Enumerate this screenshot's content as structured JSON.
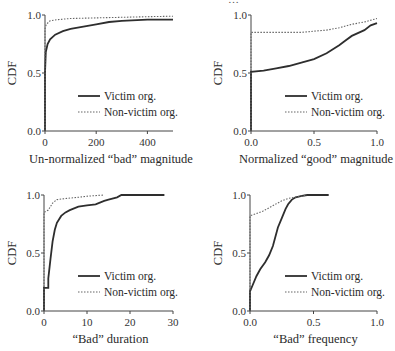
{
  "page_header": "…",
  "legend": {
    "victim": "Victim org.",
    "nonvictim": "Non-victim org."
  },
  "chart_data": [
    {
      "type": "line",
      "title": "",
      "xlabel": "Un-normalized “bad” magnitude",
      "ylabel": "CDF",
      "xlim": [
        0,
        500
      ],
      "ylim": [
        0,
        1
      ],
      "xticks": [
        0,
        200,
        400
      ],
      "xtick_labels": [
        "0",
        "200",
        "400"
      ],
      "yticks": [
        0,
        0.5,
        1
      ],
      "ytick_labels": [
        "0.0",
        "0.5",
        "1.0"
      ],
      "grid": false,
      "legend_position": "lower right",
      "series": [
        {
          "name": "Victim org.",
          "style": "solid",
          "x": [
            0,
            0,
            3,
            10,
            20,
            40,
            70,
            100,
            150,
            200,
            250,
            300,
            400,
            500
          ],
          "y": [
            0,
            0.5,
            0.68,
            0.75,
            0.79,
            0.83,
            0.86,
            0.88,
            0.9,
            0.92,
            0.94,
            0.95,
            0.96,
            0.96
          ]
        },
        {
          "name": "Non-victim org.",
          "style": "dotted",
          "x": [
            0,
            0,
            5,
            20,
            50,
            100,
            200,
            300,
            400,
            500
          ],
          "y": [
            0,
            0.88,
            0.92,
            0.95,
            0.96,
            0.97,
            0.975,
            0.98,
            0.985,
            0.99
          ]
        }
      ]
    },
    {
      "type": "line",
      "title": "",
      "xlabel": "Normalized “good” magnitude",
      "ylabel": "CDF",
      "xlim": [
        0,
        1
      ],
      "ylim": [
        0,
        1
      ],
      "xticks": [
        0,
        0.5,
        1
      ],
      "xtick_labels": [
        "0.0",
        "0.5",
        "1.0"
      ],
      "yticks": [
        0,
        0.5,
        1
      ],
      "ytick_labels": [
        "0.0",
        "0.5",
        "1.0"
      ],
      "grid": false,
      "legend_position": "lower right",
      "series": [
        {
          "name": "Victim org.",
          "style": "solid",
          "x": [
            0,
            0,
            0.1,
            0.2,
            0.3,
            0.4,
            0.5,
            0.6,
            0.7,
            0.75,
            0.8,
            0.9,
            0.95,
            1.0
          ],
          "y": [
            0,
            0.51,
            0.52,
            0.54,
            0.56,
            0.59,
            0.62,
            0.67,
            0.74,
            0.78,
            0.82,
            0.87,
            0.91,
            0.93
          ]
        },
        {
          "name": "Non-victim org.",
          "style": "dotted",
          "x": [
            0,
            0,
            0.2,
            0.4,
            0.5,
            0.6,
            0.7,
            0.8,
            0.9,
            1.0
          ],
          "y": [
            0,
            0.85,
            0.85,
            0.85,
            0.86,
            0.87,
            0.89,
            0.92,
            0.94,
            0.97
          ]
        }
      ]
    },
    {
      "type": "line",
      "title": "",
      "xlabel": "“Bad” duration",
      "ylabel": "CDF",
      "xlim": [
        0,
        30
      ],
      "ylim": [
        0,
        1
      ],
      "xticks": [
        0,
        10,
        20,
        30
      ],
      "xtick_labels": [
        "0",
        "10",
        "20",
        "30"
      ],
      "yticks": [
        0,
        0.5,
        1
      ],
      "ytick_labels": [
        "0.0",
        "0.5",
        "1.0"
      ],
      "grid": false,
      "legend_position": "lower right",
      "series": [
        {
          "name": "Victim org.",
          "style": "solid",
          "x": [
            0,
            0,
            1,
            1,
            1.5,
            2,
            2.5,
            3,
            4,
            5,
            6,
            8,
            10,
            12,
            14,
            15,
            17,
            18,
            28
          ],
          "y": [
            0,
            0.2,
            0.2,
            0.28,
            0.45,
            0.6,
            0.7,
            0.76,
            0.82,
            0.85,
            0.87,
            0.9,
            0.91,
            0.92,
            0.95,
            0.96,
            0.98,
            1.0,
            1.0
          ]
        },
        {
          "name": "Non-victim org.",
          "style": "dotted",
          "x": [
            0,
            0,
            1,
            2,
            3,
            5,
            8,
            10,
            14
          ],
          "y": [
            0,
            0.85,
            0.87,
            0.93,
            0.96,
            0.97,
            0.98,
            0.99,
            1.0
          ]
        }
      ]
    },
    {
      "type": "line",
      "title": "",
      "xlabel": "“Bad” frequency",
      "ylabel": "CDF",
      "xlim": [
        0,
        1
      ],
      "ylim": [
        0,
        1
      ],
      "xticks": [
        0,
        0.5,
        1
      ],
      "xtick_labels": [
        "0.0",
        "0.5",
        "1.0"
      ],
      "yticks": [
        0,
        0.5,
        1
      ],
      "ytick_labels": [
        "0.0",
        "0.5",
        "1.0"
      ],
      "grid": false,
      "legend_position": "lower right",
      "series": [
        {
          "name": "Victim org.",
          "style": "solid",
          "x": [
            0,
            0,
            0.02,
            0.05,
            0.08,
            0.12,
            0.15,
            0.18,
            0.2,
            0.22,
            0.25,
            0.28,
            0.3,
            0.33,
            0.36,
            0.4,
            0.45,
            0.62
          ],
          "y": [
            0,
            0.17,
            0.22,
            0.3,
            0.36,
            0.42,
            0.48,
            0.56,
            0.64,
            0.72,
            0.8,
            0.88,
            0.92,
            0.96,
            0.98,
            0.99,
            1.0,
            1.0
          ]
        },
        {
          "name": "Non-victim org.",
          "style": "dotted",
          "x": [
            0,
            0,
            0.05,
            0.1,
            0.15,
            0.2,
            0.25,
            0.3,
            0.35,
            0.4,
            0.45
          ],
          "y": [
            0,
            0.82,
            0.84,
            0.86,
            0.89,
            0.92,
            0.95,
            0.97,
            0.98,
            0.99,
            1.0
          ]
        }
      ]
    }
  ]
}
